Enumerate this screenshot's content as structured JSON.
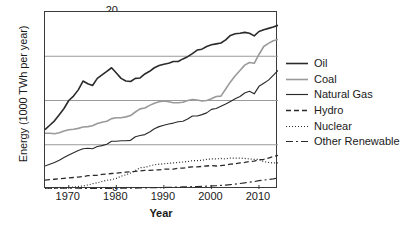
{
  "chart_data": {
    "type": "line",
    "title": "",
    "xlabel": "Year",
    "ylabel": "Energy (1000 TWh per year)",
    "xlim": [
      1965,
      2014
    ],
    "ylim": [
      0,
      20
    ],
    "xticks": [
      1970,
      1980,
      1990,
      2000,
      2010
    ],
    "yticks": [
      0,
      5,
      10,
      15,
      20
    ],
    "grid": "horizontal",
    "legend_position": "right",
    "x": [
      1965,
      1966,
      1967,
      1968,
      1969,
      1970,
      1971,
      1972,
      1973,
      1974,
      1975,
      1976,
      1977,
      1978,
      1979,
      1980,
      1981,
      1982,
      1983,
      1984,
      1985,
      1986,
      1987,
      1988,
      1989,
      1990,
      1991,
      1992,
      1993,
      1994,
      1995,
      1996,
      1997,
      1998,
      1999,
      2000,
      2001,
      2002,
      2003,
      2004,
      2005,
      2006,
      2007,
      2008,
      2009,
      2010,
      2011,
      2012,
      2013,
      2014
    ],
    "series": [
      {
        "name": "Oil",
        "color": "#2b2b2b",
        "width": 1.6,
        "dash": "none",
        "values": [
          6.7,
          7.2,
          7.7,
          8.4,
          9.1,
          10.0,
          10.5,
          11.2,
          12.2,
          11.9,
          11.7,
          12.5,
          12.9,
          13.3,
          13.7,
          13.1,
          12.5,
          12.2,
          12.15,
          12.5,
          12.55,
          13.0,
          13.3,
          13.7,
          13.95,
          14.1,
          14.2,
          14.4,
          14.4,
          14.7,
          14.95,
          15.3,
          15.7,
          15.8,
          16.1,
          16.3,
          16.4,
          16.5,
          16.85,
          17.35,
          17.55,
          17.6,
          17.7,
          17.6,
          17.3,
          17.8,
          18.0,
          18.15,
          18.3,
          18.5
        ]
      },
      {
        "name": "Coal",
        "color": "#9a9a9a",
        "width": 1.6,
        "dash": "none",
        "values": [
          6.3,
          6.3,
          6.25,
          6.35,
          6.55,
          6.7,
          6.75,
          6.85,
          7.0,
          7.05,
          7.15,
          7.4,
          7.55,
          7.65,
          7.95,
          8.05,
          8.05,
          8.15,
          8.3,
          8.7,
          9.05,
          9.15,
          9.45,
          9.7,
          9.85,
          9.95,
          9.85,
          9.75,
          9.75,
          9.8,
          10.0,
          10.1,
          10.05,
          9.95,
          10.0,
          10.2,
          10.45,
          10.5,
          11.3,
          12.1,
          12.8,
          13.4,
          14.0,
          14.3,
          14.2,
          15.2,
          16.1,
          16.45,
          16.75,
          16.9
        ]
      },
      {
        "name": "Natural Gas",
        "color": "#2b2b2b",
        "width": 1.15,
        "dash": "none",
        "values": [
          2.6,
          2.8,
          3.0,
          3.25,
          3.55,
          3.85,
          4.1,
          4.35,
          4.55,
          4.6,
          4.55,
          4.8,
          4.9,
          5.05,
          5.4,
          5.4,
          5.45,
          5.45,
          5.5,
          5.9,
          6.05,
          6.15,
          6.45,
          6.8,
          7.05,
          7.2,
          7.35,
          7.45,
          7.6,
          7.65,
          7.9,
          8.25,
          8.25,
          8.4,
          8.6,
          9.0,
          9.1,
          9.35,
          9.6,
          9.9,
          10.2,
          10.45,
          10.85,
          11.05,
          10.75,
          11.6,
          11.95,
          12.3,
          12.85,
          13.4
        ]
      },
      {
        "name": "Hydro",
        "color": "#2b2b2b",
        "width": 1.3,
        "dash": "5,3",
        "values": [
          1.0,
          1.05,
          1.1,
          1.15,
          1.2,
          1.25,
          1.3,
          1.35,
          1.4,
          1.5,
          1.55,
          1.55,
          1.65,
          1.7,
          1.75,
          1.8,
          1.85,
          1.9,
          1.95,
          2.0,
          2.05,
          2.1,
          2.1,
          2.15,
          2.15,
          2.25,
          2.25,
          2.25,
          2.35,
          2.35,
          2.45,
          2.5,
          2.5,
          2.55,
          2.6,
          2.65,
          2.6,
          2.65,
          2.7,
          2.8,
          2.85,
          2.95,
          3.0,
          3.1,
          3.15,
          3.3,
          3.35,
          3.5,
          3.65,
          3.8
        ]
      },
      {
        "name": "Nuclear",
        "color": "#2b2b2b",
        "width": 1.2,
        "dash": "1,2",
        "values": [
          0.05,
          0.06,
          0.08,
          0.1,
          0.13,
          0.17,
          0.22,
          0.28,
          0.35,
          0.45,
          0.6,
          0.7,
          0.85,
          1.0,
          1.05,
          1.2,
          1.45,
          1.6,
          1.8,
          2.1,
          2.4,
          2.45,
          2.6,
          2.75,
          2.8,
          2.85,
          2.9,
          2.95,
          3.0,
          3.05,
          3.1,
          3.2,
          3.2,
          3.25,
          3.35,
          3.4,
          3.4,
          3.45,
          3.4,
          3.5,
          3.5,
          3.5,
          3.45,
          3.4,
          3.35,
          3.35,
          3.1,
          3.0,
          2.95,
          2.95
        ]
      },
      {
        "name": "Other Renewable",
        "color": "#2b2b2b",
        "width": 1.2,
        "dash": "7,3,2,3",
        "values": [
          0.01,
          0.01,
          0.02,
          0.02,
          0.02,
          0.03,
          0.03,
          0.03,
          0.04,
          0.04,
          0.05,
          0.05,
          0.06,
          0.06,
          0.07,
          0.08,
          0.09,
          0.09,
          0.1,
          0.11,
          0.12,
          0.13,
          0.14,
          0.15,
          0.16,
          0.18,
          0.19,
          0.2,
          0.21,
          0.23,
          0.25,
          0.26,
          0.28,
          0.3,
          0.32,
          0.35,
          0.37,
          0.4,
          0.44,
          0.49,
          0.55,
          0.62,
          0.7,
          0.78,
          0.84,
          0.95,
          1.0,
          1.08,
          1.15,
          1.25
        ]
      }
    ]
  },
  "legend": {
    "items": [
      {
        "label": "Oil"
      },
      {
        "label": "Coal"
      },
      {
        "label": "Natural Gas"
      },
      {
        "label": "Hydro"
      },
      {
        "label": "Nuclear"
      },
      {
        "label": "Other Renewable"
      }
    ]
  },
  "colors": {
    "axis": "#3a3a3a",
    "grid": "#9a9a9a",
    "text": "#1a1a1a",
    "oil": "#2b2b2b",
    "coal": "#9a9a9a",
    "natural_gas": "#2b2b2b"
  }
}
